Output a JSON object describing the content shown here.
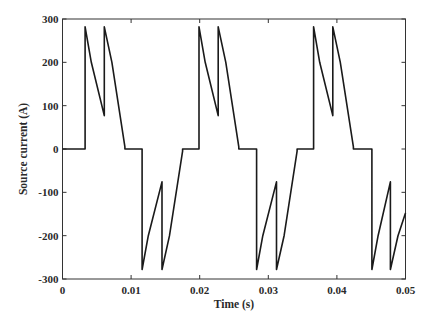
{
  "chart_data": {
    "type": "line",
    "title": "",
    "xlabel": "Time (s)",
    "ylabel": "Source current (A)",
    "xlim": [
      0,
      0.05
    ],
    "ylim": [
      -300,
      300
    ],
    "xticks": [
      0,
      0.01,
      0.02,
      0.03,
      0.04,
      0.05
    ],
    "xtick_labels": [
      "0",
      "0.01",
      "0.02",
      "0.03",
      "0.04",
      "0.05"
    ],
    "yticks": [
      -300,
      -200,
      -100,
      0,
      100,
      200,
      300
    ],
    "ytick_labels": [
      "-300",
      "-200",
      "-100",
      "0",
      "100",
      "200",
      "300"
    ],
    "grid": false,
    "legend": null,
    "series": [
      {
        "name": "Source current",
        "color": "#1a1a1a",
        "points": [
          [
            0.0,
            0
          ],
          [
            0.0033,
            0
          ],
          [
            0.0033,
            282
          ],
          [
            0.0042,
            200
          ],
          [
            0.0061,
            77
          ],
          [
            0.0061,
            282
          ],
          [
            0.0072,
            200
          ],
          [
            0.0091,
            5
          ],
          [
            0.0091,
            0
          ],
          [
            0.0116,
            0
          ],
          [
            0.0116,
            -278
          ],
          [
            0.0125,
            -200
          ],
          [
            0.0145,
            -76
          ],
          [
            0.0145,
            -278
          ],
          [
            0.0156,
            -200
          ],
          [
            0.0175,
            -5
          ],
          [
            0.0175,
            0
          ],
          [
            0.0199,
            0
          ],
          [
            0.0199,
            282
          ],
          [
            0.0208,
            200
          ],
          [
            0.0227,
            77
          ],
          [
            0.0227,
            282
          ],
          [
            0.0238,
            200
          ],
          [
            0.0257,
            5
          ],
          [
            0.0257,
            0
          ],
          [
            0.0283,
            0
          ],
          [
            0.0283,
            -278
          ],
          [
            0.0292,
            -200
          ],
          [
            0.0312,
            -76
          ],
          [
            0.0312,
            -278
          ],
          [
            0.0323,
            -200
          ],
          [
            0.0342,
            -5
          ],
          [
            0.0342,
            0
          ],
          [
            0.0366,
            0
          ],
          [
            0.0366,
            282
          ],
          [
            0.0375,
            200
          ],
          [
            0.0394,
            77
          ],
          [
            0.0394,
            282
          ],
          [
            0.0405,
            200
          ],
          [
            0.0424,
            5
          ],
          [
            0.0424,
            0
          ],
          [
            0.0451,
            0
          ],
          [
            0.0451,
            -278
          ],
          [
            0.046,
            -200
          ],
          [
            0.0478,
            -76
          ],
          [
            0.0478,
            -278
          ],
          [
            0.0489,
            -200
          ],
          [
            0.05,
            -148
          ]
        ]
      }
    ]
  },
  "layout": {
    "plot_left": 62.5,
    "plot_right": 405.5,
    "plot_top": 19,
    "plot_bottom": 279
  }
}
